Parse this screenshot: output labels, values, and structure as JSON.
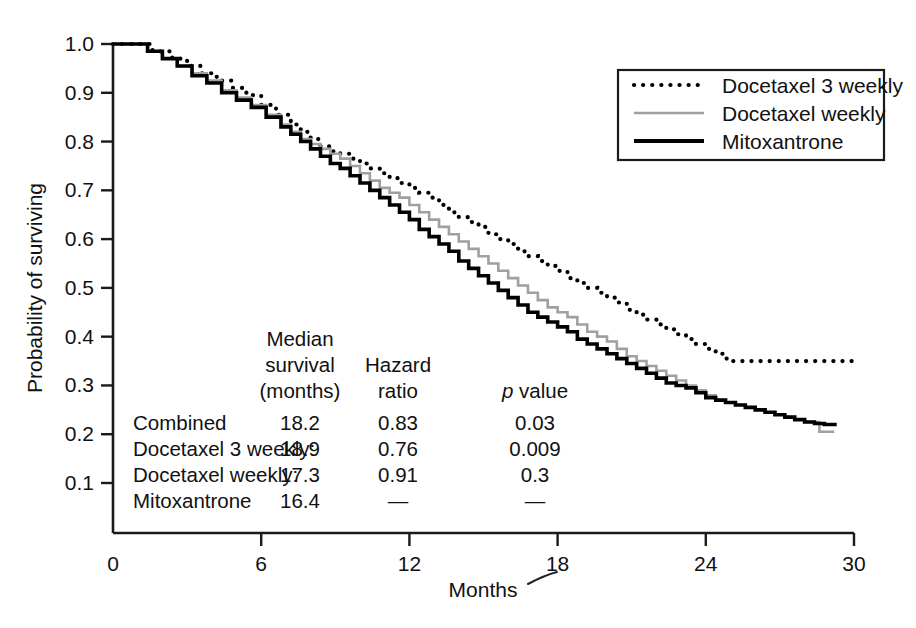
{
  "chart_data": {
    "type": "line",
    "subtype": "kaplan-meier-step",
    "title": "",
    "xlabel": "Months",
    "ylabel": "Probability of surviving",
    "xlim": [
      0,
      30
    ],
    "ylim": [
      0.05,
      1.0
    ],
    "xticks": [
      "0",
      "6",
      "12",
      "18",
      "24",
      "30"
    ],
    "xtick_values": [
      0,
      6,
      12,
      18,
      24,
      30
    ],
    "yticks": [
      "0.1",
      "0.2",
      "0.3",
      "0.4",
      "0.5",
      "0.6",
      "0.7",
      "0.8",
      "0.9",
      "1.0"
    ],
    "ytick_values": [
      0.1,
      0.2,
      0.3,
      0.4,
      0.5,
      0.6,
      0.7,
      0.8,
      0.9,
      1.0
    ],
    "grid": false,
    "legend_position": "top-right",
    "series": [
      {
        "name": "Docetaxel 3 weekly",
        "style": "dotted",
        "color": "#000000",
        "x": [
          0,
          0.8,
          1.6,
          2.4,
          3.0,
          3.6,
          4.2,
          4.8,
          5.4,
          6.0,
          6.6,
          7.2,
          7.6,
          8.0,
          8.4,
          8.8,
          9.2,
          9.6,
          10.0,
          10.4,
          10.8,
          11.2,
          11.6,
          12.0,
          12.4,
          12.8,
          13.2,
          13.6,
          14.0,
          14.4,
          14.8,
          15.2,
          15.6,
          16.0,
          16.4,
          16.8,
          17.2,
          17.6,
          18.0,
          18.4,
          18.8,
          19.2,
          19.6,
          20.0,
          20.4,
          20.8,
          21.2,
          21.6,
          22.0,
          22.4,
          22.8,
          23.2,
          23.6,
          24.0,
          24.4,
          24.8,
          25.0,
          30.0
        ],
        "y": [
          1.0,
          1.0,
          0.985,
          0.97,
          0.955,
          0.94,
          0.925,
          0.91,
          0.895,
          0.875,
          0.855,
          0.835,
          0.82,
          0.805,
          0.79,
          0.78,
          0.775,
          0.765,
          0.755,
          0.745,
          0.735,
          0.725,
          0.715,
          0.705,
          0.695,
          0.685,
          0.67,
          0.655,
          0.645,
          0.635,
          0.625,
          0.61,
          0.6,
          0.59,
          0.575,
          0.565,
          0.555,
          0.545,
          0.535,
          0.52,
          0.51,
          0.5,
          0.49,
          0.48,
          0.47,
          0.455,
          0.445,
          0.435,
          0.425,
          0.415,
          0.405,
          0.395,
          0.385,
          0.375,
          0.365,
          0.355,
          0.35,
          0.35
        ]
      },
      {
        "name": "Docetaxel weekly",
        "style": "solid-gray",
        "color": "#a0a0a0",
        "x": [
          0,
          0.8,
          1.4,
          2.0,
          2.6,
          3.2,
          3.8,
          4.4,
          5.0,
          5.6,
          6.2,
          6.8,
          7.2,
          7.6,
          8.0,
          8.4,
          8.8,
          9.2,
          9.6,
          10.0,
          10.4,
          10.8,
          11.2,
          11.6,
          12.0,
          12.4,
          12.8,
          13.2,
          13.6,
          14.0,
          14.4,
          14.8,
          15.2,
          15.6,
          16.0,
          16.4,
          16.8,
          17.2,
          17.6,
          18.0,
          18.4,
          18.8,
          19.2,
          19.6,
          20.0,
          20.4,
          20.8,
          21.2,
          21.6,
          22.0,
          22.4,
          22.8,
          23.2,
          23.6,
          24.0,
          24.4,
          24.8,
          25.2,
          25.6,
          26.0,
          26.4,
          26.8,
          27.2,
          27.6,
          28.0,
          28.6,
          29.2
        ],
        "y": [
          1.0,
          1.0,
          0.985,
          0.97,
          0.955,
          0.94,
          0.925,
          0.905,
          0.89,
          0.875,
          0.855,
          0.835,
          0.82,
          0.805,
          0.795,
          0.785,
          0.775,
          0.765,
          0.75,
          0.735,
          0.72,
          0.705,
          0.695,
          0.685,
          0.67,
          0.655,
          0.64,
          0.625,
          0.61,
          0.595,
          0.58,
          0.565,
          0.55,
          0.535,
          0.52,
          0.505,
          0.49,
          0.475,
          0.46,
          0.45,
          0.44,
          0.425,
          0.41,
          0.4,
          0.39,
          0.375,
          0.36,
          0.35,
          0.34,
          0.33,
          0.32,
          0.31,
          0.3,
          0.29,
          0.28,
          0.27,
          0.265,
          0.26,
          0.255,
          0.25,
          0.245,
          0.24,
          0.235,
          0.23,
          0.225,
          0.205,
          0.205
        ]
      },
      {
        "name": "Mitoxantrone",
        "style": "solid-black",
        "color": "#000000",
        "x": [
          0,
          0.8,
          1.4,
          2.0,
          2.6,
          3.2,
          3.8,
          4.4,
          5.0,
          5.6,
          6.2,
          6.8,
          7.2,
          7.6,
          8.0,
          8.4,
          8.8,
          9.2,
          9.6,
          10.0,
          10.4,
          10.8,
          11.2,
          11.6,
          12.0,
          12.4,
          12.8,
          13.2,
          13.6,
          14.0,
          14.4,
          14.8,
          15.2,
          15.6,
          16.0,
          16.4,
          16.8,
          17.2,
          17.6,
          18.0,
          18.4,
          18.8,
          19.2,
          19.6,
          20.0,
          20.4,
          20.8,
          21.2,
          21.6,
          22.0,
          22.4,
          22.8,
          23.2,
          23.6,
          24.0,
          24.4,
          24.8,
          25.2,
          25.6,
          26.0,
          26.4,
          26.8,
          27.2,
          27.6,
          28.0,
          28.4,
          28.8,
          29.3
        ],
        "y": [
          1.0,
          1.0,
          0.985,
          0.97,
          0.955,
          0.935,
          0.92,
          0.9,
          0.885,
          0.87,
          0.85,
          0.83,
          0.815,
          0.8,
          0.785,
          0.77,
          0.755,
          0.745,
          0.73,
          0.715,
          0.7,
          0.685,
          0.67,
          0.655,
          0.64,
          0.62,
          0.605,
          0.59,
          0.575,
          0.555,
          0.54,
          0.525,
          0.51,
          0.495,
          0.48,
          0.465,
          0.45,
          0.44,
          0.43,
          0.42,
          0.41,
          0.395,
          0.385,
          0.375,
          0.365,
          0.355,
          0.345,
          0.335,
          0.325,
          0.315,
          0.305,
          0.3,
          0.295,
          0.285,
          0.275,
          0.27,
          0.265,
          0.26,
          0.255,
          0.25,
          0.245,
          0.24,
          0.235,
          0.23,
          0.225,
          0.222,
          0.22,
          0.22
        ]
      }
    ]
  },
  "axes": {
    "ylabel": "Probability of surviving",
    "xlabel": "Months",
    "yticks": [
      "1.0",
      "0.9",
      "0.8",
      "0.7",
      "0.6",
      "0.5",
      "0.4",
      "0.3",
      "0.2",
      "0.1"
    ],
    "xticks": [
      "0",
      "6",
      "12",
      "18",
      "24",
      "30"
    ]
  },
  "legend": {
    "items": [
      {
        "label": "Docetaxel 3 weekly",
        "style": "dotted",
        "color": "#000000"
      },
      {
        "label": "Docetaxel weekly",
        "style": "solid",
        "color": "#a0a0a0"
      },
      {
        "label": "Mitoxantrone",
        "style": "solid",
        "color": "#000000"
      }
    ]
  },
  "stats_table": {
    "headers": {
      "col1_line1": "Median",
      "col1_line2": "survival",
      "col1_line3": "(months)",
      "col2_line2": "Hazard",
      "col2_line3": "ratio",
      "col3_italic": "p",
      "col3_rest": " value"
    },
    "rows": [
      {
        "label": "Combined",
        "median_survival": "18.2",
        "hazard_ratio": "0.83",
        "p_value": "0.03"
      },
      {
        "label": "Docetaxel 3 weekly:",
        "median_survival": "18.9",
        "hazard_ratio": "0.76",
        "p_value": "0.009"
      },
      {
        "label": "Docetaxel weekly:",
        "median_survival": "17.3",
        "hazard_ratio": "0.91",
        "p_value": "0.3"
      },
      {
        "label": "Mitoxantrone",
        "median_survival": "16.4",
        "hazard_ratio": "—",
        "p_value": "—"
      }
    ]
  },
  "colors": {
    "axis": "#1a1a1a",
    "text": "#111111",
    "series_gray": "#a0a0a0",
    "series_black": "#000000",
    "background": "#ffffff"
  }
}
